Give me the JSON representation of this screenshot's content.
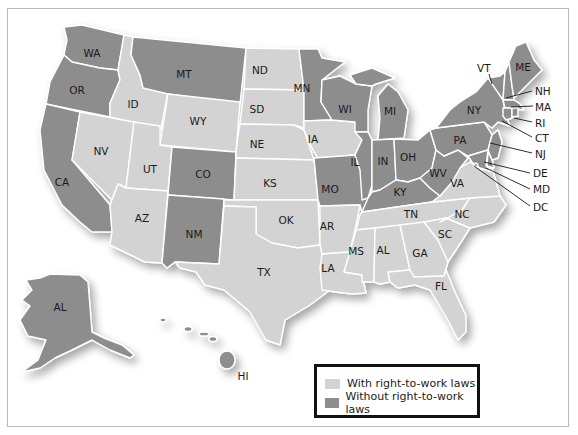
{
  "colors": {
    "with_laws": "#d3d3d3",
    "without_laws": "#8d8d8d",
    "border": "#ffffff"
  },
  "legend": {
    "items": [
      {
        "label": "With right-to-work laws",
        "color": "#d3d3d3"
      },
      {
        "label": "Without right-to-work laws",
        "color": "#8d8d8d"
      }
    ]
  },
  "states": {
    "WA": {
      "label": "WA",
      "right_to_work": false
    },
    "OR": {
      "label": "OR",
      "right_to_work": false
    },
    "CA": {
      "label": "CA",
      "right_to_work": false
    },
    "ID": {
      "label": "ID",
      "right_to_work": true
    },
    "NV": {
      "label": "NV",
      "right_to_work": true
    },
    "MT": {
      "label": "MT",
      "right_to_work": false
    },
    "WY": {
      "label": "WY",
      "right_to_work": true
    },
    "UT": {
      "label": "UT",
      "right_to_work": true
    },
    "AZ": {
      "label": "AZ",
      "right_to_work": true
    },
    "CO": {
      "label": "CO",
      "right_to_work": false
    },
    "NM": {
      "label": "NM",
      "right_to_work": false
    },
    "ND": {
      "label": "ND",
      "right_to_work": true
    },
    "SD": {
      "label": "SD",
      "right_to_work": true
    },
    "NE": {
      "label": "NE",
      "right_to_work": true
    },
    "KS": {
      "label": "KS",
      "right_to_work": true
    },
    "OK": {
      "label": "OK",
      "right_to_work": true
    },
    "TX": {
      "label": "TX",
      "right_to_work": true
    },
    "MN": {
      "label": "MN",
      "right_to_work": false
    },
    "IA": {
      "label": "IA",
      "right_to_work": true
    },
    "MO": {
      "label": "MO",
      "right_to_work": false
    },
    "AR": {
      "label": "AR",
      "right_to_work": true
    },
    "LA": {
      "label": "LA",
      "right_to_work": true
    },
    "WI": {
      "label": "WI",
      "right_to_work": false
    },
    "IL": {
      "label": "IL",
      "right_to_work": false
    },
    "MI": {
      "label": "MI",
      "right_to_work": false
    },
    "IN": {
      "label": "IN",
      "right_to_work": false
    },
    "OH": {
      "label": "OH",
      "right_to_work": false
    },
    "KY": {
      "label": "KY",
      "right_to_work": false
    },
    "TN": {
      "label": "TN",
      "right_to_work": true
    },
    "MS": {
      "label": "MS",
      "right_to_work": true
    },
    "AL": {
      "label": "AL",
      "right_to_work": true
    },
    "GA": {
      "label": "GA",
      "right_to_work": true
    },
    "FL": {
      "label": "FL",
      "right_to_work": true
    },
    "SC": {
      "label": "SC",
      "right_to_work": true
    },
    "NC": {
      "label": "NC",
      "right_to_work": true
    },
    "VA": {
      "label": "VA",
      "right_to_work": true
    },
    "WV": {
      "label": "WV",
      "right_to_work": false
    },
    "PA": {
      "label": "PA",
      "right_to_work": false
    },
    "NY": {
      "label": "NY",
      "right_to_work": false
    },
    "VT": {
      "label": "VT",
      "right_to_work": false
    },
    "NH": {
      "label": "NH",
      "right_to_work": false
    },
    "ME": {
      "label": "ME",
      "right_to_work": false
    },
    "MA": {
      "label": "MA",
      "right_to_work": false
    },
    "RI": {
      "label": "RI",
      "right_to_work": false
    },
    "CT": {
      "label": "CT",
      "right_to_work": false
    },
    "NJ": {
      "label": "NJ",
      "right_to_work": false
    },
    "DE": {
      "label": "DE",
      "right_to_work": false
    },
    "MD": {
      "label": "MD",
      "right_to_work": false
    },
    "DC": {
      "label": "DC",
      "right_to_work": false
    },
    "AK": {
      "label": "AL",
      "right_to_work": false
    },
    "HI": {
      "label": "HI",
      "right_to_work": false
    }
  }
}
